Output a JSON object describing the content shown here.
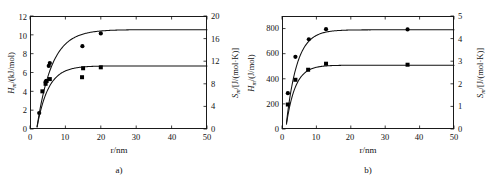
{
  "figure": {
    "background": "#ffffff",
    "line_color": "#111111",
    "marker_color": "#000000"
  },
  "panels": [
    {
      "id": "a",
      "caption": "a)",
      "xlabel": "r/nm",
      "left_axis_title_main": "H",
      "left_axis_title_sub": "m",
      "left_axis_title_rest": "/(kJ/mol)",
      "right_axis_title_main": "S",
      "right_axis_title_sub": "m",
      "right_axis_title_rest": "/[J/(mol·K)]",
      "xticks": [
        "0",
        "10",
        "20",
        "30",
        "40",
        "50"
      ],
      "left_yticks": [
        "0",
        "2",
        "4",
        "6",
        "8",
        "10",
        "12"
      ],
      "right_yticks": [
        "0",
        "4",
        "8",
        "12",
        "16",
        "20"
      ]
    },
    {
      "id": "b",
      "caption": "b)",
      "xlabel": "r/nm",
      "left_axis_title_main": "H",
      "left_axis_title_sub": "m",
      "left_axis_title_rest": "/(J/mol)",
      "right_axis_title_main": "S",
      "right_axis_title_sub": "m",
      "right_axis_title_rest": "/[J/(mol·K)]",
      "xticks": [
        "0",
        "10",
        "20",
        "30",
        "40",
        "50"
      ],
      "left_yticks": [
        "0",
        "200",
        "400",
        "600",
        "800"
      ],
      "right_yticks": [
        "0",
        "1",
        "2",
        "3",
        "4",
        "5"
      ]
    }
  ],
  "chart_data": [
    {
      "type": "scatter",
      "panel": "a",
      "title": "",
      "xlabel": "r/nm",
      "ylabel": "H_m/(kJ/mol)",
      "y2label": "S_m/[J/(mol·K)]",
      "xlim": [
        0,
        50
      ],
      "ylim": [
        0,
        12
      ],
      "y2lim": [
        0,
        20
      ],
      "xticks": [
        0,
        10,
        20,
        30,
        40,
        50
      ],
      "yticks": [
        0,
        2,
        4,
        6,
        8,
        10,
        12
      ],
      "y2ticks": [
        0,
        4,
        8,
        12,
        16,
        20
      ],
      "grid": false,
      "legend": "none",
      "series": [
        {
          "name": "molar enthalpy H_m",
          "marker": "circle",
          "axis": "left",
          "points": [
            {
              "x": 2.6,
              "y": 1.7
            },
            {
              "x": 4.4,
              "y": 5.0
            },
            {
              "x": 5.3,
              "y": 6.7
            },
            {
              "x": 5.6,
              "y": 7.0
            },
            {
              "x": 14.8,
              "y": 8.8
            },
            {
              "x": 20.0,
              "y": 10.15
            }
          ],
          "fit_curve": {
            "model": "H = Hinf*(1 - exp(-(x-x0)/tau))",
            "Hinf": 10.55,
            "x0": 1.9,
            "tau": 4.2,
            "x_start": 2.0,
            "x_end": 50.0,
            "note": "saturating rise from ~0.4 at r=2 nm to ~10.3 at r=50 nm"
          }
        },
        {
          "name": "molar entropy S_m",
          "marker": "square",
          "axis": "left",
          "points": [
            {
              "x": 3.5,
              "y": 4.0
            },
            {
              "x": 4.4,
              "y": 4.8
            },
            {
              "x": 4.7,
              "y": 5.1
            },
            {
              "x": 5.6,
              "y": 5.3
            },
            {
              "x": 14.7,
              "y": 5.5
            },
            {
              "x": 15.0,
              "y": 6.45
            },
            {
              "x": 20.0,
              "y": 6.55
            }
          ],
          "fit_curve": {
            "model": "S = Sinf*(1 - exp(-(x-x0)/tau))",
            "Sinf": 6.7,
            "x0": 1.9,
            "tau": 3.2,
            "x_start": 2.0,
            "x_end": 50.0,
            "note": "saturating rise from ~0.3 at r=2 nm to ~6.65 at r=50 nm"
          }
        }
      ]
    },
    {
      "type": "scatter",
      "panel": "b",
      "title": "",
      "xlabel": "r/nm",
      "ylabel": "H_m/(J/mol)",
      "y2label": "S_m/[J/(mol·K)]",
      "xlim": [
        0,
        50
      ],
      "ylim": [
        0,
        900
      ],
      "y2lim": [
        0,
        5
      ],
      "xticks": [
        0,
        10,
        20,
        30,
        40,
        50
      ],
      "yticks": [
        0,
        200,
        400,
        600,
        800
      ],
      "y2ticks": [
        0,
        1,
        2,
        3,
        4,
        5
      ],
      "grid": false,
      "legend": "none",
      "series": [
        {
          "name": "molar enthalpy H_m",
          "marker": "circle",
          "axis": "left",
          "points": [
            {
              "x": 1.7,
              "y": 285
            },
            {
              "x": 3.9,
              "y": 575
            },
            {
              "x": 7.8,
              "y": 715
            },
            {
              "x": 12.8,
              "y": 795
            },
            {
              "x": 36.5,
              "y": 793
            }
          ],
          "fit_curve": {
            "model": "H = Hinf*(1 - exp(-(x-x0)/tau))",
            "Hinf": 790,
            "x0": 1.1,
            "tau": 3.1,
            "x_start": 1.3,
            "x_end": 50.0,
            "note": "steep rise saturating near 780 J/mol"
          }
        },
        {
          "name": "molar entropy S_m",
          "marker": "square",
          "axis": "left",
          "points": [
            {
              "x": 1.7,
              "y": 195
            },
            {
              "x": 3.9,
              "y": 392
            },
            {
              "x": 7.6,
              "y": 472
            },
            {
              "x": 12.8,
              "y": 520
            },
            {
              "x": 36.5,
              "y": 512
            }
          ],
          "fit_curve": {
            "model": "S = Sinf*(1 - exp(-(x-x0)/tau))",
            "Sinf": 508,
            "x0": 1.1,
            "tau": 2.6,
            "x_start": 1.3,
            "x_end": 50.0,
            "note": "steep rise saturating near 505 J/mol (right axis ~2.8)"
          }
        }
      ]
    }
  ]
}
